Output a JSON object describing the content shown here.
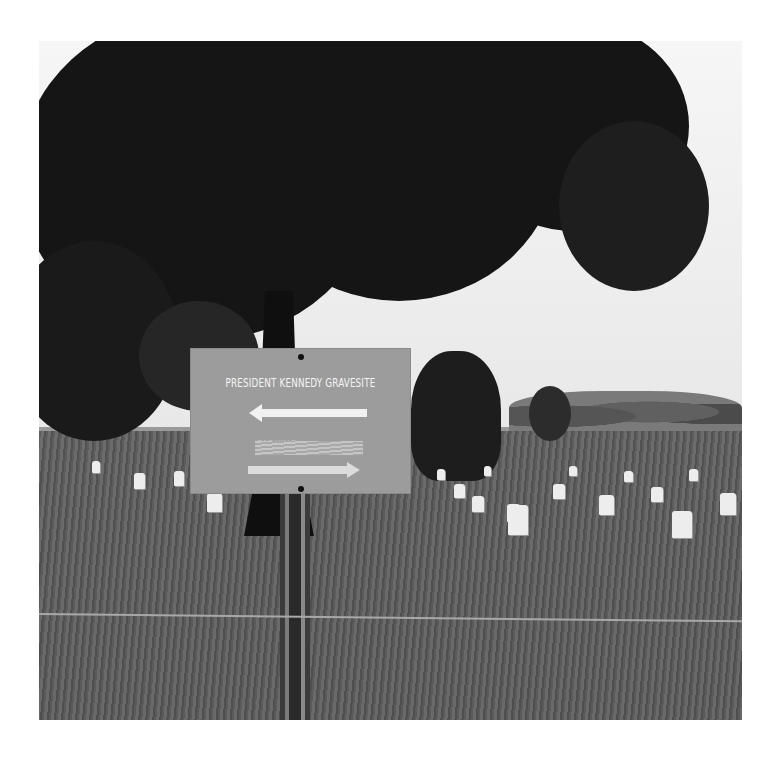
{
  "photo": {
    "description": "Black-and-white photograph of a directional sign in a national cemetery with rows of white headstones, a large tree and a wire fence",
    "palette": {
      "sky": "#efefef",
      "foliage": "#151515",
      "grass": "#5e5e5e",
      "sign": "#9c9c9c",
      "sign_text": "#f4f4f4",
      "headstone": "#ededed"
    }
  },
  "sign": {
    "line1": "PRESIDENT KENNEDY GRAVESITE",
    "line1_direction": "arrow-left",
    "line2": "PARKING",
    "line2_state": "scratched out / obscured",
    "line2_direction": "arrow-right"
  }
}
